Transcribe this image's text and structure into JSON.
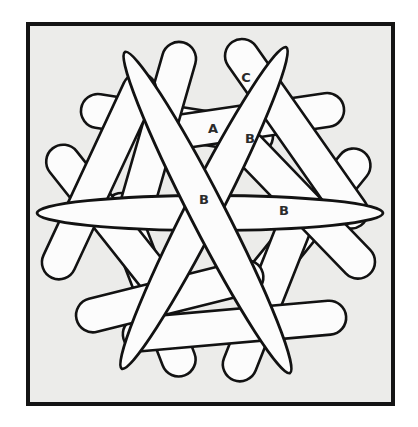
{
  "figure": {
    "canvas": {
      "width": 418,
      "height": 427,
      "background": "#ffffff"
    },
    "frame": {
      "x": 28,
      "y": 24,
      "width": 365,
      "height": 380,
      "fill": "#ececea",
      "stroke": "#141414",
      "stroke_width": 4
    },
    "style": {
      "stick_fill": "#fcfcfc",
      "stick_stroke": "#121212",
      "capsule_stroke_width": 2.6,
      "rod_stroke_width": 2.8,
      "label_color": "#2b2b2b",
      "label_font_size": 13
    },
    "sticks": [
      {
        "id": "capsule-top-left-horizontal",
        "type": "capsule",
        "cx": 177.0,
        "cy": 123.5,
        "length": 194,
        "width": 34,
        "angle": 9
      },
      {
        "id": "capsule-top-right-horizontal",
        "type": "capsule",
        "cx": 247.9,
        "cy": 121.7,
        "length": 194,
        "width": 34,
        "angle": 171.6
      },
      {
        "id": "capsule-right-upper-diagonal",
        "type": "capsule",
        "cx": 303.1,
        "cy": 227.7,
        "length": 194,
        "width": 34,
        "angle": 129
      },
      {
        "id": "capsule-bottom-right-diagonal",
        "type": "capsule",
        "cx": 269.3,
        "cy": 289.9,
        "length": 194,
        "width": 34,
        "angle": 291.6
      },
      {
        "id": "capsule-bottom-left-diagonal",
        "type": "capsule",
        "cx": 149.9,
        "cy": 284.8,
        "length": 194,
        "width": 34,
        "angle": 249
      },
      {
        "id": "capsule-left-upper-diagonal",
        "type": "capsule",
        "cx": 112.9,
        "cy": 224.4,
        "length": 194,
        "width": 34,
        "angle": 51.6
      },
      {
        "id": "capsule-top-center-left",
        "type": "capsule",
        "cx": 157.2,
        "cy": 134.9,
        "length": 192,
        "width": 34,
        "angle": 106
      },
      {
        "id": "capsule-top-center-right-C",
        "type": "capsule",
        "cx": 296.5,
        "cy": 133.8,
        "length": 224,
        "width": 34,
        "angle": 55
      },
      {
        "id": "capsule-right-mid-diagonal",
        "type": "capsule",
        "cx": 303.1,
        "cy": 204.8,
        "length": 192,
        "width": 34,
        "angle": 226
      },
      {
        "id": "capsule-bottom-horizontal",
        "type": "capsule",
        "cx": 234.5,
        "cy": 326.0,
        "length": 224,
        "width": 34,
        "angle": 175
      },
      {
        "id": "capsule-bottom-center-left",
        "type": "capsule",
        "cx": 169.7,
        "cy": 296.2,
        "length": 192,
        "width": 34,
        "angle": 346
      },
      {
        "id": "capsule-left-mid-diagonal",
        "type": "capsule",
        "cx": 99.1,
        "cy": 176.2,
        "length": 224,
        "width": 34,
        "angle": 295
      },
      {
        "id": "rod-horizontal-B",
        "type": "ellipse",
        "cx": 210.0,
        "cy": 213.0,
        "rx": 173.0,
        "ry": 17.5,
        "angle": 0
      },
      {
        "id": "rod-diagonal-up-right-B",
        "type": "ellipse",
        "cx": 204.0,
        "cy": 208.0,
        "rx": 180.5,
        "ry": 17.5,
        "angle": -62.9
      },
      {
        "id": "rod-diagonal-down-right-B",
        "type": "ellipse",
        "cx": 207.5,
        "cy": 212.5,
        "rx": 180.5,
        "ry": 17.5,
        "angle": 62.8
      }
    ],
    "labels": [
      {
        "text": "A",
        "x": 213,
        "y": 128
      },
      {
        "text": "B",
        "x": 250,
        "y": 138
      },
      {
        "text": "B",
        "x": 204,
        "y": 199
      },
      {
        "text": "B",
        "x": 284,
        "y": 210
      },
      {
        "text": "C",
        "x": 246,
        "y": 77
      }
    ]
  }
}
